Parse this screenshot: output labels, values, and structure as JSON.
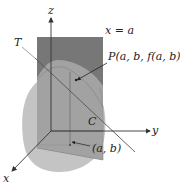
{
  "diagram": {
    "type": "3d-surface-tangent-line",
    "colors": {
      "background": "#ffffff",
      "plane": "#7d7d7d",
      "plane_dark": "#6c6c6c",
      "surface": "#bdbdbd",
      "surface_light": "#cfcfcf",
      "axis": "#333333",
      "tangent": "#555555",
      "label": "#222222"
    },
    "labels": {
      "z_axis": "z",
      "y_axis": "y",
      "x_axis": "x",
      "plane": "x = a",
      "tangent": "T",
      "point": "P(a, b, f(a, b))",
      "curve": "C",
      "base_point": "(a, b)"
    }
  }
}
